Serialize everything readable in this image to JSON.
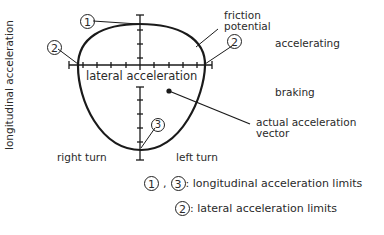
{
  "diagram": {
    "y_axis_label": "longitudinal acceleration",
    "x_axis_label": "lateral acceleration",
    "friction_label_line1": "friction",
    "friction_label_line2": "potential",
    "accelerating_label": "accelerating",
    "braking_label": "braking",
    "vector_label_line1": "actual acceleration",
    "vector_label_line2": "vector",
    "right_turn_label": "right turn",
    "left_turn_label": "left turn",
    "marker_1": "1",
    "marker_2_left": "2",
    "marker_2_right": "2",
    "marker_3": "3"
  },
  "legend": {
    "row1": {
      "m1": "1",
      "sep": ",",
      "m3": "3",
      "text": ": longitudinal acceleration limits"
    },
    "row2": {
      "m2": "2",
      "text": ": lateral acceleration limits"
    }
  },
  "colors": {
    "line": "#1a1a1a",
    "text": "#2a2a2a",
    "background": "#ffffff"
  }
}
